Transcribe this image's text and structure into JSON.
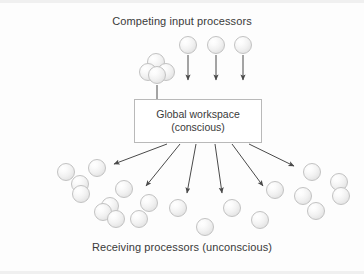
{
  "diagram": {
    "title_top": "Competing input processors",
    "title_bottom": "Receiving processors (unconscious)",
    "workspace": {
      "line1": "Global workspace",
      "line2": "(conscious)"
    },
    "colors": {
      "background": "#fdfdfd",
      "text": "#3a3a3a",
      "box_border": "#b9b9b9",
      "sphere_fill": "#efefef",
      "sphere_stroke": "#c2c2c2",
      "arrow": "#4a4a4a"
    },
    "input_spheres": [
      {
        "cx": 156,
        "cy": 62,
        "r": 9
      },
      {
        "cx": 148,
        "cy": 72,
        "r": 9
      },
      {
        "cx": 166,
        "cy": 72,
        "r": 9
      },
      {
        "cx": 157,
        "cy": 75,
        "r": 9
      },
      {
        "cx": 188,
        "cy": 45,
        "r": 9
      },
      {
        "cx": 216,
        "cy": 45,
        "r": 9
      },
      {
        "cx": 243,
        "cy": 45,
        "r": 9
      }
    ],
    "input_arrows": [
      {
        "x1": 157,
        "y1": 85,
        "x2": 157,
        "y2": 106
      },
      {
        "x1": 188,
        "y1": 55,
        "x2": 188,
        "y2": 80
      },
      {
        "x1": 216,
        "y1": 55,
        "x2": 216,
        "y2": 80
      },
      {
        "x1": 243,
        "y1": 55,
        "x2": 243,
        "y2": 80
      }
    ],
    "output_arrows": [
      {
        "x1": 167,
        "y1": 144,
        "x2": 114,
        "y2": 164
      },
      {
        "x1": 180,
        "y1": 144,
        "x2": 146,
        "y2": 186
      },
      {
        "x1": 196,
        "y1": 144,
        "x2": 187,
        "y2": 193
      },
      {
        "x1": 215,
        "y1": 144,
        "x2": 222,
        "y2": 193
      },
      {
        "x1": 232,
        "y1": 144,
        "x2": 263,
        "y2": 186
      },
      {
        "x1": 249,
        "y1": 144,
        "x2": 294,
        "y2": 166
      }
    ],
    "receiving_spheres": [
      {
        "cx": 66,
        "cy": 172,
        "r": 9
      },
      {
        "cx": 97,
        "cy": 168,
        "r": 9
      },
      {
        "cx": 80,
        "cy": 184,
        "r": 9
      },
      {
        "cx": 81,
        "cy": 194,
        "r": 9
      },
      {
        "cx": 124,
        "cy": 189,
        "r": 9
      },
      {
        "cx": 110,
        "cy": 206,
        "r": 9
      },
      {
        "cx": 103,
        "cy": 212,
        "r": 9
      },
      {
        "cx": 116,
        "cy": 219,
        "r": 9
      },
      {
        "cx": 139,
        "cy": 219,
        "r": 9
      },
      {
        "cx": 149,
        "cy": 203,
        "r": 9
      },
      {
        "cx": 178,
        "cy": 208,
        "r": 9
      },
      {
        "cx": 205,
        "cy": 227,
        "r": 9
      },
      {
        "cx": 232,
        "cy": 208,
        "r": 9
      },
      {
        "cx": 260,
        "cy": 220,
        "r": 9
      },
      {
        "cx": 275,
        "cy": 190,
        "r": 9
      },
      {
        "cx": 303,
        "cy": 196,
        "r": 9
      },
      {
        "cx": 312,
        "cy": 172,
        "r": 9
      },
      {
        "cx": 339,
        "cy": 182,
        "r": 9
      },
      {
        "cx": 341,
        "cy": 196,
        "r": 9
      },
      {
        "cx": 316,
        "cy": 211,
        "r": 9
      }
    ]
  }
}
